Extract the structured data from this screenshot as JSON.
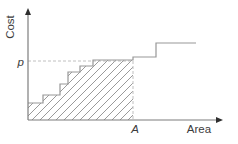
{
  "figure": {
    "y_axis_label": "Cost",
    "x_axis_label": "Area",
    "price_label": "p",
    "area_label": "A",
    "colors": {
      "background": "#ffffff",
      "axis": "#7d7d7d",
      "arrow": "#2e2e2e",
      "step_line": "#979797",
      "hatch_line": "#9a9a9a",
      "dashed_line": "#c0c0c0",
      "text": "#3c3c3c"
    },
    "geometry": {
      "width": 238,
      "height": 144,
      "origin": [
        28,
        120
      ],
      "y_axis_top": 8,
      "x_axis_right": 223,
      "p_level_y": 61,
      "area_marker_x": 133,
      "hatch_spacing": 8,
      "staircase": [
        [
          28,
          103
        ],
        [
          43,
          103
        ],
        [
          43,
          95
        ],
        [
          60,
          95
        ],
        [
          60,
          84
        ],
        [
          68,
          84
        ],
        [
          68,
          72
        ],
        [
          80,
          72
        ],
        [
          80,
          66
        ],
        [
          93,
          66
        ],
        [
          93,
          60
        ],
        [
          133,
          60
        ],
        [
          133,
          57
        ],
        [
          156,
          57
        ],
        [
          156,
          43
        ],
        [
          196,
          43
        ]
      ]
    }
  }
}
